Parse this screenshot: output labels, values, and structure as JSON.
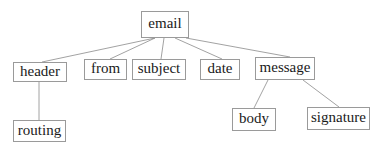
{
  "diagram": {
    "type": "tree",
    "colors": {
      "edge": "#8a8a8a",
      "border": "#9a9a9a",
      "text": "#1a1a1a",
      "background": "#ffffff"
    },
    "nodes": [
      {
        "id": "email",
        "label": "email",
        "x": 141,
        "y": 11,
        "w": 48,
        "h": 27
      },
      {
        "id": "header",
        "label": "header",
        "x": 13,
        "y": 62,
        "w": 54,
        "h": 20
      },
      {
        "id": "from",
        "label": "from",
        "x": 84,
        "y": 59,
        "w": 43,
        "h": 21
      },
      {
        "id": "subject",
        "label": "subject",
        "x": 132,
        "y": 59,
        "w": 54,
        "h": 21
      },
      {
        "id": "date",
        "label": "date",
        "x": 200,
        "y": 59,
        "w": 40,
        "h": 21
      },
      {
        "id": "message",
        "label": "message",
        "x": 255,
        "y": 57,
        "w": 60,
        "h": 23
      },
      {
        "id": "routing",
        "label": "routing",
        "x": 13,
        "y": 120,
        "w": 53,
        "h": 22
      },
      {
        "id": "body",
        "label": "body",
        "x": 232,
        "y": 108,
        "w": 44,
        "h": 23
      },
      {
        "id": "signature",
        "label": "signature",
        "x": 307,
        "y": 107,
        "w": 63,
        "h": 23
      }
    ],
    "edges": [
      {
        "from": "email",
        "to": "header",
        "x1": 155,
        "y1": 38,
        "x2": 42,
        "y2": 62
      },
      {
        "from": "email",
        "to": "from",
        "x1": 155,
        "y1": 38,
        "x2": 110,
        "y2": 59
      },
      {
        "from": "email",
        "to": "subject",
        "x1": 164,
        "y1": 38,
        "x2": 161,
        "y2": 59
      },
      {
        "from": "email",
        "to": "date",
        "x1": 175,
        "y1": 38,
        "x2": 222,
        "y2": 59
      },
      {
        "from": "email",
        "to": "message",
        "x1": 186,
        "y1": 38,
        "x2": 290,
        "y2": 57
      },
      {
        "from": "header",
        "to": "routing",
        "x1": 39,
        "y1": 82,
        "x2": 39,
        "y2": 120
      },
      {
        "from": "message",
        "to": "body",
        "x1": 268,
        "y1": 80,
        "x2": 254,
        "y2": 108
      },
      {
        "from": "message",
        "to": "signature",
        "x1": 303,
        "y1": 80,
        "x2": 339,
        "y2": 107
      }
    ]
  }
}
